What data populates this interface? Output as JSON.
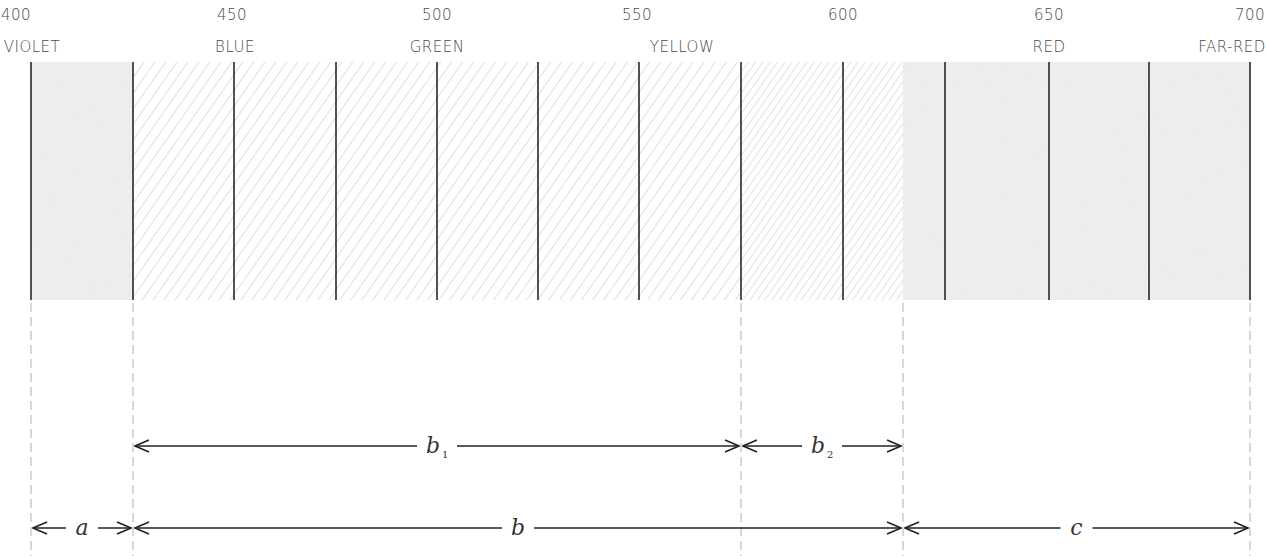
{
  "diagram": {
    "title": "",
    "scale": {
      "wavelengths": [
        {
          "value": "400",
          "x": 16
        },
        {
          "value": "450",
          "x": 232
        },
        {
          "value": "500",
          "x": 437
        },
        {
          "value": "550",
          "x": 637
        },
        {
          "value": "600",
          "x": 843
        },
        {
          "value": "650",
          "x": 1049
        },
        {
          "value": "700",
          "x": 1250
        }
      ],
      "color_names": [
        {
          "label": "VIOLET",
          "x": 32
        },
        {
          "label": "BLUE",
          "x": 235
        },
        {
          "label": "GREEN",
          "x": 437
        },
        {
          "label": "YELLOW",
          "x": 682
        },
        {
          "label": "RED",
          "x": 1049
        },
        {
          "label": "FAR-RED",
          "x": 1232
        }
      ]
    },
    "band": {
      "top": 62,
      "bottom": 300,
      "divider_x": [
        31,
        133,
        234,
        336,
        437,
        538,
        639,
        741,
        843,
        945,
        1049,
        1149,
        1250
      ],
      "regions": [
        {
          "name": "violet-stipple",
          "x1": 31,
          "x2": 133,
          "fill": "stipple"
        },
        {
          "name": "hatched",
          "x1": 133,
          "x2": 741,
          "fill": "hatch"
        },
        {
          "name": "hatched-dense",
          "x1": 741,
          "x2": 903,
          "fill": "hatch-dense"
        },
        {
          "name": "red-stipple",
          "x1": 903,
          "x2": 1250,
          "fill": "stipple"
        }
      ]
    },
    "dashed_guides_x": [
      31,
      133,
      741,
      903,
      1250
    ],
    "ranges": [
      {
        "label": "b",
        "subscript": "1",
        "x1": 133,
        "x2": 741,
        "y": 446
      },
      {
        "label": "b",
        "subscript": "2",
        "x1": 741,
        "x2": 903,
        "y": 446
      },
      {
        "label": "a",
        "subscript": "",
        "x1": 31,
        "x2": 133,
        "y": 528
      },
      {
        "label": "b",
        "subscript": "",
        "x1": 133,
        "x2": 903,
        "y": 528
      },
      {
        "label": "c",
        "subscript": "",
        "x1": 903,
        "x2": 1250,
        "y": 528
      }
    ],
    "colors": {
      "stipple": "#ececec",
      "hatch_line": "#c8c8c8",
      "divider": "#1a1a1a",
      "dashed": "#bdbdbd",
      "arrow": "#222222"
    }
  }
}
